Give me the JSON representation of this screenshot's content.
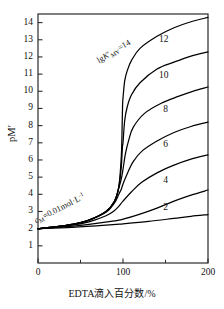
{
  "chart_data": {
    "type": "line",
    "title": "",
    "xlabel": "EDTA滴入百分数/%",
    "ylabel": "pM′",
    "xlim": [
      0,
      200
    ],
    "ylim": [
      0,
      14.5
    ],
    "grid": false,
    "legend": "inline-right",
    "xticks": [
      "0",
      "100",
      "200"
    ],
    "xtick_values": [
      0,
      100,
      200
    ],
    "yticks": [
      "1",
      "2",
      "3",
      "4",
      "5",
      "6",
      "7",
      "8",
      "9",
      "10",
      "11",
      "12",
      "13",
      "14"
    ],
    "ytick_values": [
      1,
      2,
      3,
      4,
      5,
      6,
      7,
      8,
      9,
      10,
      11,
      12,
      13,
      14
    ],
    "annotations": [
      {
        "name": "top-curve-label",
        "text": "lgK′MY=14",
        "rich": {
          "lead": "lg",
          "italic": "K",
          "prime": "′",
          "sub": "MY",
          "tail": "=14"
        },
        "x": 100,
        "y": 13.2,
        "rotation": -31
      },
      {
        "name": "concentration-label",
        "text": "cM=0.01mol·L-1",
        "rich": {
          "italic": "c",
          "sub": "M",
          "mid": "=0.01mol·L",
          "sup": "-1"
        },
        "x": 12,
        "y": 3.6,
        "rotation": -27
      }
    ],
    "series": [
      {
        "name": "14",
        "label": "lgK′MY=14",
        "lgK": 14,
        "color": "#000000",
        "points": [
          [
            0,
            2.0
          ],
          [
            20,
            2.1
          ],
          [
            40,
            2.25
          ],
          [
            60,
            2.5
          ],
          [
            80,
            3.0
          ],
          [
            90,
            3.6
          ],
          [
            95,
            4.4
          ],
          [
            98,
            6.2
          ],
          [
            99,
            8.0
          ],
          [
            99.5,
            9.2
          ],
          [
            100,
            9.6
          ],
          [
            102,
            10.6
          ],
          [
            105,
            11.2
          ],
          [
            110,
            11.8
          ],
          [
            120,
            12.5
          ],
          [
            140,
            13.2
          ],
          [
            160,
            13.7
          ],
          [
            180,
            14.05
          ],
          [
            200,
            14.3
          ]
        ]
      },
      {
        "name": "12",
        "label": "12",
        "lgK": 12,
        "color": "#000000",
        "points": [
          [
            0,
            2.0
          ],
          [
            20,
            2.1
          ],
          [
            40,
            2.25
          ],
          [
            60,
            2.5
          ],
          [
            80,
            3.0
          ],
          [
            90,
            3.6
          ],
          [
            95,
            4.4
          ],
          [
            98,
            5.6
          ],
          [
            99,
            6.5
          ],
          [
            99.6,
            6.9
          ],
          [
            100,
            7.0
          ],
          [
            102,
            8.3
          ],
          [
            105,
            9.1
          ],
          [
            110,
            9.8
          ],
          [
            120,
            10.5
          ],
          [
            140,
            11.3
          ],
          [
            160,
            11.7
          ],
          [
            180,
            12.05
          ],
          [
            200,
            12.3
          ]
        ]
      },
      {
        "name": "10",
        "label": "10",
        "lgK": 10,
        "color": "#000000",
        "points": [
          [
            0,
            2.0
          ],
          [
            20,
            2.1
          ],
          [
            40,
            2.25
          ],
          [
            60,
            2.5
          ],
          [
            80,
            3.0
          ],
          [
            90,
            3.6
          ],
          [
            95,
            4.35
          ],
          [
            98,
            4.9
          ],
          [
            100,
            5.45
          ],
          [
            103,
            6.4
          ],
          [
            107,
            7.2
          ],
          [
            112,
            7.9
          ],
          [
            125,
            8.7
          ],
          [
            145,
            9.3
          ],
          [
            165,
            9.7
          ],
          [
            182,
            10.0
          ],
          [
            200,
            10.25
          ]
        ]
      },
      {
        "name": "8",
        "label": "8",
        "lgK": 8,
        "color": "#000000",
        "points": [
          [
            0,
            2.0
          ],
          [
            20,
            2.1
          ],
          [
            40,
            2.25
          ],
          [
            60,
            2.5
          ],
          [
            80,
            2.95
          ],
          [
            90,
            3.5
          ],
          [
            95,
            4.0
          ],
          [
            98,
            4.3
          ],
          [
            100,
            4.6
          ],
          [
            105,
            5.2
          ],
          [
            112,
            5.9
          ],
          [
            122,
            6.5
          ],
          [
            140,
            7.1
          ],
          [
            160,
            7.6
          ],
          [
            180,
            7.95
          ],
          [
            200,
            8.2
          ]
        ]
      },
      {
        "name": "6",
        "label": "6",
        "lgK": 6,
        "color": "#000000",
        "points": [
          [
            0,
            2.0
          ],
          [
            20,
            2.08
          ],
          [
            40,
            2.2
          ],
          [
            60,
            2.4
          ],
          [
            80,
            2.75
          ],
          [
            90,
            3.05
          ],
          [
            95,
            3.3
          ],
          [
            100,
            3.6
          ],
          [
            110,
            4.15
          ],
          [
            122,
            4.7
          ],
          [
            140,
            5.25
          ],
          [
            160,
            5.7
          ],
          [
            180,
            6.05
          ],
          [
            200,
            6.3
          ]
        ]
      },
      {
        "name": "4",
        "label": "4",
        "lgK": 4,
        "color": "#000000",
        "points": [
          [
            0,
            2.0
          ],
          [
            30,
            2.1
          ],
          [
            60,
            2.25
          ],
          [
            90,
            2.45
          ],
          [
            100,
            2.55
          ],
          [
            120,
            2.85
          ],
          [
            140,
            3.2
          ],
          [
            160,
            3.6
          ],
          [
            180,
            3.95
          ],
          [
            200,
            4.25
          ]
        ]
      },
      {
        "name": "2",
        "label": "2",
        "lgK": 2,
        "color": "#000000",
        "points": [
          [
            0,
            2.0
          ],
          [
            40,
            2.08
          ],
          [
            80,
            2.2
          ],
          [
            100,
            2.28
          ],
          [
            130,
            2.42
          ],
          [
            160,
            2.6
          ],
          [
            180,
            2.72
          ],
          [
            200,
            2.82
          ]
        ]
      }
    ],
    "series_labels": [
      {
        "text": "12",
        "x": 148,
        "y": 13.0
      },
      {
        "text": "10",
        "x": 148,
        "y": 10.9
      },
      {
        "text": "8",
        "x": 150,
        "y": 8.9
      },
      {
        "text": "6",
        "x": 150,
        "y": 6.9
      },
      {
        "text": "4",
        "x": 150,
        "y": 4.75
      },
      {
        "text": "2",
        "x": 150,
        "y": 3.2
      }
    ]
  }
}
